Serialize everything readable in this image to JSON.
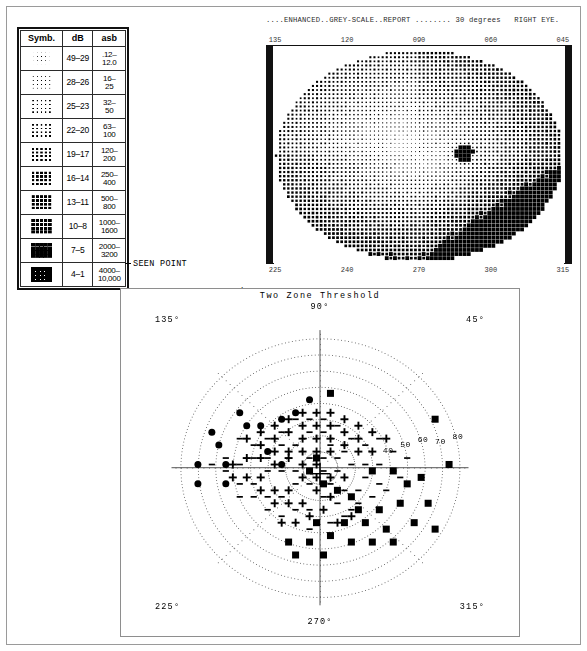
{
  "report": {
    "header_line": "....ENHANCED..GREY-SCALE..REPORT ........ 30 degrees   RIGHT EYE.",
    "title_enhanced": "ENHANCED",
    "title_greyscale": "GREY-SCALE",
    "title_report": "REPORT",
    "degrees": "30 degrees",
    "eye": "RIGHT EYE."
  },
  "legend": {
    "headers": [
      "Symb.",
      "dB",
      "asb"
    ],
    "rows": [
      {
        "db": "49–29",
        "asb_top": ".12–",
        "asb_bot": "12.0",
        "density": 1
      },
      {
        "db": "28–26",
        "asb_top": "16–",
        "asb_bot": "25",
        "density": 2
      },
      {
        "db": "25–23",
        "asb_top": "32–",
        "asb_bot": "50",
        "density": 3
      },
      {
        "db": "22–20",
        "asb_top": "63–",
        "asb_bot": "100",
        "density": 4
      },
      {
        "db": "19–17",
        "asb_top": "120–",
        "asb_bot": "200",
        "density": 5
      },
      {
        "db": "16–14",
        "asb_top": "250–",
        "asb_bot": "400",
        "density": 6
      },
      {
        "db": "13–11",
        "asb_top": "500–",
        "asb_bot": "800",
        "density": 7
      },
      {
        "db": "10–8",
        "asb_top": "1000–",
        "asb_bot": "1600",
        "density": 8
      },
      {
        "db": "7–5",
        "asb_top": "2000–",
        "asb_bot": "3200",
        "density": 9
      },
      {
        "db": "4–1",
        "asb_top": "4000–",
        "asb_bot": "10,000",
        "density": 10
      }
    ]
  },
  "symbol_key": [
    {
      "glyph": "dash",
      "label": "SEEN POINT",
      "value": "",
      "stimulus": ""
    },
    {
      "glyph": "plus",
      "label": "MISSED AT",
      "value": "50",
      "stimulus": "I-2b"
    },
    {
      "glyph": "dot",
      "label": "MISSED AT",
      "value": "160",
      "stimulus": "I-3b"
    },
    {
      "glyph": "square",
      "label": "MISSED AT",
      "value": "500",
      "stimulus": "I-4b"
    }
  ],
  "greyscale": {
    "axis_top": [
      "135",
      "120",
      "090",
      "060",
      "045"
    ],
    "axis_bottom": [
      "225",
      "240",
      "270",
      "300",
      "315"
    ],
    "blind_spot": {
      "label": "blind-spot",
      "present": true
    }
  },
  "polar": {
    "title": "Two Zone Threshold",
    "angles": {
      "top": "90°",
      "upper_left": "135°",
      "upper_right": "45°",
      "lower_left": "225°",
      "lower_right": "315°",
      "bottom": "270°"
    },
    "radial_labels": [
      "40",
      "50",
      "60",
      "70",
      "80"
    ]
  },
  "chart_data": {
    "type": "scatter",
    "title": "Two Zone Threshold",
    "subtitle": "ENHANCED GREY-SCALE REPORT — 30 degrees, RIGHT EYE",
    "xlabel": "Horizontal meridian (degrees)",
    "ylabel": "Vertical meridian (degrees)",
    "xlim": [
      -85,
      85
    ],
    "ylim": [
      -85,
      85
    ],
    "grid": "polar-dotted",
    "legend_position": "above-plot",
    "radial_rings": [
      10,
      20,
      30,
      40,
      50,
      60,
      70,
      80
    ],
    "meridians": [
      45,
      90,
      135,
      180,
      225,
      270,
      315,
      360
    ],
    "series": [
      {
        "name": "SEEN POINT",
        "symbol": "dash",
        "stimulus": "",
        "asb": "",
        "count": 64,
        "points": [
          [
            -6,
            22
          ],
          [
            2,
            22
          ],
          [
            -14,
            14
          ],
          [
            -22,
            14
          ],
          [
            6,
            14
          ],
          [
            14,
            10
          ],
          [
            -30,
            6
          ],
          [
            -38,
            6
          ],
          [
            -6,
            6
          ],
          [
            2,
            6
          ],
          [
            10,
            6
          ],
          [
            18,
            2
          ],
          [
            -14,
            -2
          ],
          [
            -22,
            -2
          ],
          [
            -30,
            -2
          ],
          [
            2,
            -2
          ],
          [
            10,
            -2
          ],
          [
            -6,
            -10
          ],
          [
            -14,
            -10
          ],
          [
            -38,
            -10
          ],
          [
            6,
            -10
          ],
          [
            14,
            -14
          ],
          [
            22,
            -14
          ],
          [
            -22,
            -18
          ],
          [
            -30,
            -18
          ],
          [
            2,
            -18
          ],
          [
            10,
            -22
          ],
          [
            -6,
            -26
          ],
          [
            -14,
            -26
          ],
          [
            18,
            -26
          ],
          [
            26,
            2
          ],
          [
            34,
            2
          ],
          [
            -46,
            2
          ],
          [
            -54,
            -2
          ],
          [
            26,
            -6
          ],
          [
            34,
            -10
          ],
          [
            42,
            -2
          ],
          [
            -46,
            -10
          ],
          [
            -30,
            18
          ],
          [
            -22,
            22
          ],
          [
            18,
            18
          ],
          [
            26,
            14
          ],
          [
            -38,
            14
          ],
          [
            -46,
            18
          ],
          [
            34,
            18
          ],
          [
            10,
            26
          ],
          [
            2,
            30
          ],
          [
            -6,
            30
          ],
          [
            -14,
            30
          ],
          [
            42,
            10
          ],
          [
            50,
            6
          ],
          [
            -54,
            6
          ],
          [
            -62,
            2
          ],
          [
            -38,
            -18
          ],
          [
            -46,
            -18
          ],
          [
            22,
            -22
          ],
          [
            30,
            -18
          ],
          [
            38,
            -14
          ],
          [
            -30,
            -26
          ],
          [
            -22,
            -30
          ],
          [
            14,
            -30
          ],
          [
            6,
            -34
          ],
          [
            -6,
            -38
          ],
          [
            46,
            -6
          ]
        ]
      },
      {
        "name": "MISSED AT 50",
        "symbol": "plus",
        "stimulus": "I-2b",
        "asb": "50",
        "count": 58,
        "points": [
          [
            -10,
            34
          ],
          [
            -2,
            34
          ],
          [
            6,
            34
          ],
          [
            14,
            30
          ],
          [
            -18,
            30
          ],
          [
            -26,
            26
          ],
          [
            -34,
            22
          ],
          [
            22,
            26
          ],
          [
            30,
            22
          ],
          [
            -42,
            18
          ],
          [
            38,
            18
          ],
          [
            -10,
            26
          ],
          [
            -2,
            26
          ],
          [
            6,
            26
          ],
          [
            14,
            22
          ],
          [
            -18,
            22
          ],
          [
            -26,
            18
          ],
          [
            -34,
            14
          ],
          [
            22,
            18
          ],
          [
            -10,
            18
          ],
          [
            -2,
            18
          ],
          [
            6,
            18
          ],
          [
            -18,
            10
          ],
          [
            -26,
            10
          ],
          [
            -34,
            6
          ],
          [
            -42,
            6
          ],
          [
            -50,
            2
          ],
          [
            14,
            14
          ],
          [
            22,
            10
          ],
          [
            30,
            10
          ],
          [
            -10,
            10
          ],
          [
            -2,
            10
          ],
          [
            6,
            10
          ],
          [
            -18,
            6
          ],
          [
            -10,
            2
          ],
          [
            -2,
            2
          ],
          [
            -26,
            2
          ],
          [
            -34,
            -6
          ],
          [
            -42,
            -6
          ],
          [
            -50,
            -6
          ],
          [
            -10,
            -6
          ],
          [
            -2,
            -6
          ],
          [
            6,
            -6
          ],
          [
            14,
            -6
          ],
          [
            -18,
            -14
          ],
          [
            -26,
            -14
          ],
          [
            -34,
            -14
          ],
          [
            -2,
            -14
          ],
          [
            6,
            -18
          ],
          [
            -10,
            -22
          ],
          [
            -18,
            -22
          ],
          [
            -26,
            -22
          ],
          [
            2,
            -26
          ],
          [
            -6,
            -30
          ],
          [
            -14,
            -34
          ],
          [
            -22,
            -34
          ],
          [
            10,
            -34
          ],
          [
            18,
            -30
          ]
        ]
      },
      {
        "name": "MISSED AT 160",
        "symbol": "dot",
        "stimulus": "I-3b",
        "asb": "160",
        "count": 14,
        "points": [
          [
            -62,
            22
          ],
          [
            -70,
            2
          ],
          [
            -70,
            -10
          ],
          [
            -54,
            2
          ],
          [
            -54,
            -10
          ],
          [
            -34,
            26
          ],
          [
            -22,
            30
          ],
          [
            -14,
            34
          ],
          [
            -6,
            42
          ],
          [
            -30,
            10
          ],
          [
            -22,
            2
          ],
          [
            -42,
            26
          ],
          [
            -46,
            34
          ],
          [
            -58,
            14
          ]
        ]
      },
      {
        "name": "MISSED AT 500",
        "symbol": "square",
        "stimulus": "I-4b",
        "asb": "500",
        "count": 30,
        "points": [
          [
            6,
            46
          ],
          [
            66,
            30
          ],
          [
            74,
            2
          ],
          [
            -2,
            6
          ],
          [
            -6,
            -2
          ],
          [
            2,
            -10
          ],
          [
            30,
            -2
          ],
          [
            42,
            -2
          ],
          [
            58,
            -6
          ],
          [
            10,
            -14
          ],
          [
            22,
            -26
          ],
          [
            34,
            -26
          ],
          [
            14,
            -34
          ],
          [
            26,
            -34
          ],
          [
            46,
            -22
          ],
          [
            54,
            -34
          ],
          [
            6,
            -42
          ],
          [
            -6,
            -46
          ],
          [
            -18,
            -46
          ],
          [
            18,
            -46
          ],
          [
            30,
            -46
          ],
          [
            42,
            -46
          ],
          [
            62,
            -22
          ],
          [
            50,
            -10
          ],
          [
            -14,
            -54
          ],
          [
            2,
            -54
          ],
          [
            38,
            -38
          ],
          [
            18,
            -18
          ],
          [
            -2,
            -34
          ],
          [
            66,
            -38
          ]
        ]
      }
    ],
    "greyscale_map": {
      "type": "heatmap",
      "description": "Enhanced grey-scale depiction of retinal sensitivity, right eye, 30 degrees",
      "scale_db_ranges": [
        "49-29",
        "28-26",
        "25-23",
        "22-20",
        "19-17",
        "16-14",
        "13-11",
        "10-8",
        "7-5",
        "4-1"
      ],
      "scale_asb_ranges": [
        ".12-12.0",
        "16-25",
        "32-50",
        "63-100",
        "120-200",
        "250-400",
        "500-800",
        "1000-1600",
        "2000-3200",
        "4000-10,000"
      ],
      "blind_spot_present": true,
      "darkest_region": "temporal-inferior"
    }
  }
}
